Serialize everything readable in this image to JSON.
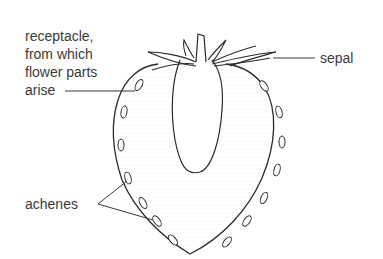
{
  "diagram": {
    "labels": {
      "receptacle_line1": "receptacle,",
      "receptacle_line2": "from which",
      "receptacle_line3": "flower parts",
      "receptacle_line4": "arise",
      "sepal": "sepal",
      "achenes": "achenes"
    },
    "colors": {
      "ink": "#2a2a2a",
      "label_text": "#3a3a3a",
      "stipple": "#c8c8c8",
      "background": "#ffffff"
    }
  }
}
